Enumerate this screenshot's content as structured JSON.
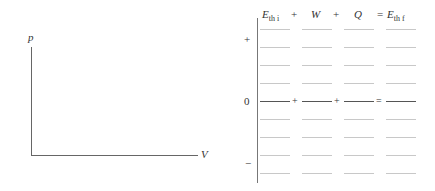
{
  "pv_diagram": {
    "y_label": "p",
    "x_label": "V"
  },
  "energy_chart": {
    "headers": {
      "col1_main": "E",
      "col1_sub": "th i",
      "op1": "+",
      "col2": "W",
      "op2": "+",
      "col3": "Q",
      "op3": "=",
      "col4_main": "E",
      "col4_sub": "th f"
    },
    "sign_labels": {
      "positive": "+",
      "zero": "0",
      "negative": "−"
    },
    "zero_row_ops": [
      "+",
      "+",
      "="
    ],
    "rows_above_zero": 4,
    "rows_below_zero": 4,
    "columns": 4
  }
}
